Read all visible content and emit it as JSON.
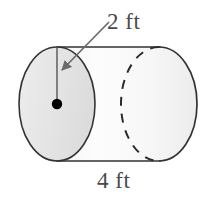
{
  "figure": {
    "kind": "cylinder-diagram",
    "caption_radius": "2 ft",
    "caption_length": "4 ft"
  },
  "geometry": {
    "shape": "cylinder",
    "radius_value": 2,
    "radius_unit": "ft",
    "length_value": 4,
    "length_unit": "ft",
    "radius_label": "2 ft",
    "length_label": "4 ft"
  },
  "style": {
    "outline_color": "#333333",
    "face_fill": "#e6e6e6",
    "body_fill_light": "#fdfdfd",
    "body_fill_dark": "#e9e9e9",
    "dash_color": "#2b2b2b",
    "leader_color": "#6b6b6b",
    "center_dot_color": "#000000",
    "text_color": "#4a4a4a",
    "background": "#ffffff"
  },
  "parts": {
    "front_face": "front-circular-face",
    "back_arc": "hidden-back-edge-dashed",
    "top_edge": "top-silhouette-line",
    "bottom_edge": "bottom-silhouette-line",
    "right_cap": "right-end-cap",
    "radius_line": "radius-segment",
    "center_dot": "center-point",
    "leader": "radius-leader-arrow"
  }
}
